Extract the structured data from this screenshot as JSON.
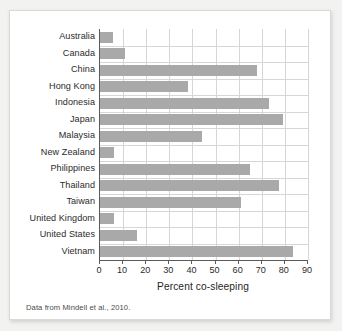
{
  "figure": {
    "caption": "Data from Mindell et al., 2010."
  },
  "chart_data": {
    "type": "bar",
    "orientation": "horizontal",
    "title": "",
    "xlabel": "Percent co-sleeping",
    "ylabel": "",
    "xlim": [
      0,
      90
    ],
    "xticks": [
      0,
      10,
      20,
      30,
      40,
      50,
      60,
      70,
      80,
      90
    ],
    "xtick_labels": [
      "0",
      "10",
      "20",
      "30",
      "40",
      "50",
      "60",
      "70",
      "80",
      "90"
    ],
    "grid": true,
    "legend": null,
    "bar_color": "#a9a9a9",
    "categories": [
      "Australia",
      "Canada",
      "China",
      "Hong Kong",
      "Indonesia",
      "Japan",
      "Malaysia",
      "New Zealand",
      "Philippines",
      "Thailand",
      "Taiwan",
      "United Kingdom",
      "United States",
      "Vietnam"
    ],
    "values": [
      5.5,
      11,
      68,
      38,
      73,
      79,
      44,
      6,
      65,
      77.5,
      61,
      6,
      16,
      83.5
    ]
  }
}
